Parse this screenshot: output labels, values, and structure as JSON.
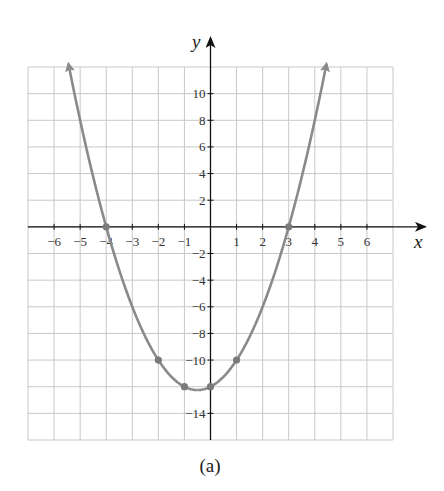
{
  "chart_data": {
    "type": "line",
    "title": "",
    "caption": "(a)",
    "xlabel": "x",
    "ylabel": "y",
    "xlim": [
      -7,
      7
    ],
    "ylim": [
      -16,
      12
    ],
    "grid": true,
    "x_ticks": [
      -6,
      -5,
      -4,
      -3,
      -2,
      -1,
      1,
      2,
      3,
      4,
      5,
      6
    ],
    "x_tick_labels": [
      "−6",
      "−5",
      "−4",
      "−3",
      "−2",
      "−1",
      "1",
      "2",
      "3",
      "4",
      "5",
      "6"
    ],
    "y_ticks": [
      10,
      8,
      6,
      4,
      2,
      -2,
      -4,
      -6,
      -8,
      -10,
      -14
    ],
    "y_tick_labels": [
      "10",
      "8",
      "6",
      "4",
      "2",
      "−2",
      "−4",
      "−6",
      "−8",
      "−10",
      "−14"
    ],
    "series": [
      {
        "name": "y = x^2 + x - 12",
        "function": "x^2 + x - 12",
        "x_range": [
          -5.45,
          4.45
        ],
        "color": "#8a8a8a",
        "arrows_at_ends": true
      }
    ],
    "points": [
      {
        "x": -4,
        "y": 0
      },
      {
        "x": 3,
        "y": 0
      },
      {
        "x": -2,
        "y": -10
      },
      {
        "x": 1,
        "y": -10
      },
      {
        "x": -1,
        "y": -12
      },
      {
        "x": 0,
        "y": -12
      }
    ],
    "vertex": {
      "x": -0.5,
      "y": -12.25
    }
  },
  "labels": {
    "x_axis": "x",
    "y_axis": "y",
    "caption": "(a)"
  }
}
